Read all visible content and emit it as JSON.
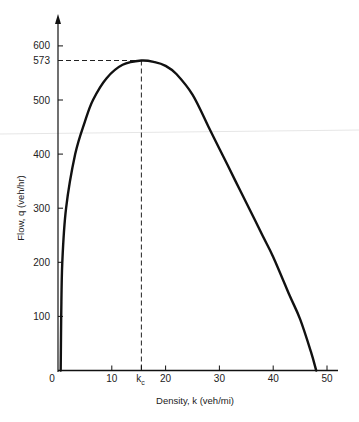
{
  "chart_data": {
    "type": "line",
    "title": "",
    "xlabel": "Density, k (veh/mi)",
    "ylabel": "Flow, q (veh/hr)",
    "xlim": [
      0,
      52
    ],
    "ylim": [
      0,
      620
    ],
    "grid": false,
    "legend": null,
    "x_ticks": [
      {
        "value": 0,
        "label": "0"
      },
      {
        "value": 10,
        "label": "10"
      },
      {
        "value": 20,
        "label": "20"
      },
      {
        "value": 30,
        "label": "30"
      },
      {
        "value": 40,
        "label": "40"
      },
      {
        "value": 50,
        "label": "50"
      }
    ],
    "y_ticks": [
      {
        "value": 100,
        "label": "100"
      },
      {
        "value": 200,
        "label": "200"
      },
      {
        "value": 300,
        "label": "300"
      },
      {
        "value": 400,
        "label": "400"
      },
      {
        "value": 500,
        "label": "500"
      },
      {
        "value": 573,
        "label": "573"
      },
      {
        "value": 600,
        "label": "600"
      }
    ],
    "annotations": [
      {
        "type": "critical-density",
        "label": "k",
        "subscript": "c",
        "x": 15.5
      },
      {
        "type": "max-flow",
        "label": "573",
        "y": 573
      },
      {
        "type": "dashed-guide-horizontal",
        "from": [
          0,
          573
        ],
        "to": [
          15.5,
          573
        ]
      },
      {
        "type": "dashed-guide-vertical",
        "from": [
          15.5,
          0
        ],
        "to": [
          15.5,
          573
        ]
      }
    ],
    "series": [
      {
        "name": "flow-density curve",
        "x": [
          0.5,
          0.6,
          0.8,
          1.5,
          3.2,
          5,
          6.5,
          9,
          12,
          15.5,
          18,
          20,
          22,
          25,
          28,
          30,
          33,
          35,
          38,
          40,
          43,
          45,
          47,
          48
        ],
        "y": [
          0,
          100,
          200,
          300,
          400,
          460,
          500,
          540,
          565,
          573,
          570,
          563,
          548,
          510,
          450,
          410,
          350,
          310,
          250,
          210,
          140,
          95,
          35,
          0
        ]
      }
    ]
  },
  "axes": {
    "x_title": "Density, k (veh/mi)",
    "y_title": "Flow, q (veh/hr)",
    "origin_label": "0",
    "kc_main": "k",
    "kc_sub": "c"
  }
}
